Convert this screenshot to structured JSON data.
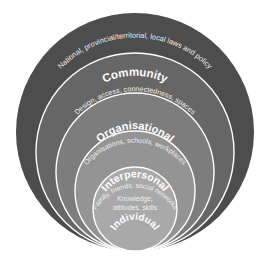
{
  "diagram": {
    "type": "nested-circles-socio-ecological-model",
    "background_color": "#ffffff",
    "ring_border_color": "#ffffff",
    "title_text_color": "#ffffff",
    "subtitle_text_color": "#efefef",
    "levels": [
      {
        "id": "public-policy",
        "title": "Public policy",
        "subtitle": "National, provincial/territorial, local laws and policy",
        "color": "#4d4d4d",
        "order": 1
      },
      {
        "id": "community",
        "title": "Community",
        "subtitle": "Design, access, connectedness, spaces",
        "color": "#666666",
        "order": 2
      },
      {
        "id": "organisational",
        "title": "Organisational",
        "subtitle": "Organisations, schools, workplaces",
        "color": "#7d7d7d",
        "order": 3
      },
      {
        "id": "interpersonal",
        "title": "Interpersonal",
        "subtitle": "Family, friends, social networks",
        "color": "#949494",
        "order": 4
      },
      {
        "id": "individual",
        "title": "Individual",
        "subtitle_line1": "Knowledge,",
        "subtitle_line2": "attitudes, skills",
        "color": "#a9a9a9",
        "order": 5
      }
    ]
  }
}
